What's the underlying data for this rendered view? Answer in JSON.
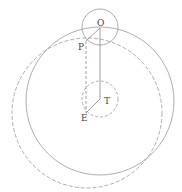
{
  "labels": {
    "O": "O",
    "P": "P",
    "T": "T",
    "E": "E"
  },
  "colors": {
    "stroke": "#888888",
    "label": "#444444"
  },
  "geometry": {
    "solid_large_circle": {
      "cx": 100,
      "cy": 101,
      "r": 74
    },
    "dashed_large_circle": {
      "cx": 87,
      "cy": 113,
      "r": 75
    },
    "small_circle_top": {
      "cx": 100,
      "cy": 27,
      "r": 18
    },
    "dashed_small_circle": {
      "cx": 100,
      "cy": 99,
      "r": 18
    }
  }
}
